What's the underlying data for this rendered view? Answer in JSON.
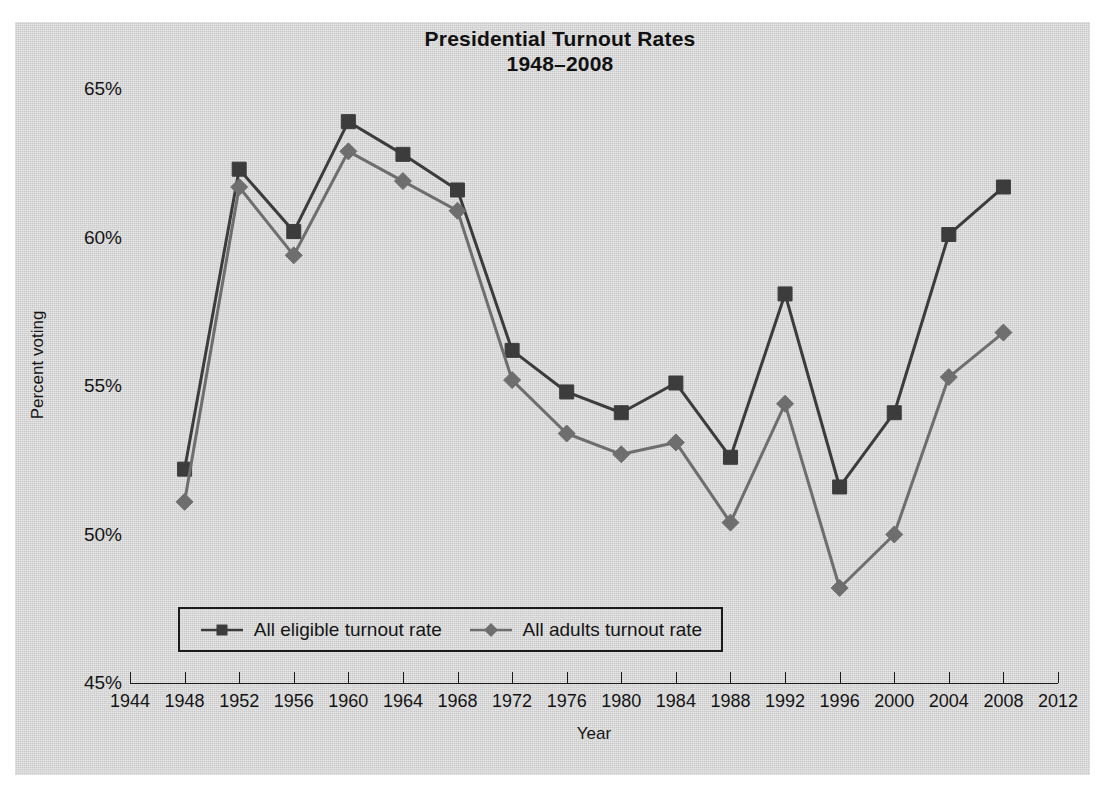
{
  "figure": {
    "title_line1": "Presidential Turnout Rates",
    "title_line2": "1948–2008",
    "panel_color": "#d8d8d8",
    "background_color": "#ffffff"
  },
  "axes": {
    "ylabel": "Percent voting",
    "xlabel": "Year",
    "yticks": [
      "65%",
      "60%",
      "55%",
      "50%",
      "45%"
    ],
    "xticks": [
      "1944",
      "1948",
      "1952",
      "1956",
      "1960",
      "1964",
      "1968",
      "1972",
      "1976",
      "1980",
      "1984",
      "1988",
      "1992",
      "1996",
      "2000",
      "2004",
      "2008",
      "2012"
    ]
  },
  "legend": {
    "entries": [
      {
        "label": "All eligible turnout rate",
        "marker": "square",
        "color": "#3c3c3c"
      },
      {
        "label": "All adults turnout rate",
        "marker": "diamond",
        "color": "#6e6e6e"
      }
    ]
  },
  "chart_data": {
    "type": "line",
    "title": "Presidential Turnout Rates 1948–2008",
    "xlabel": "Year",
    "ylabel": "Percent voting",
    "xlim": [
      1944,
      2012
    ],
    "ylim": [
      45,
      65
    ],
    "grid": false,
    "legend_position": "inside-bottom-left",
    "x": [
      1948,
      1952,
      1956,
      1960,
      1964,
      1968,
      1972,
      1976,
      1980,
      1984,
      1988,
      1992,
      1996,
      2000,
      2004,
      2008
    ],
    "categories": [
      "1948",
      "1952",
      "1956",
      "1960",
      "1964",
      "1968",
      "1972",
      "1976",
      "1980",
      "1984",
      "1988",
      "1992",
      "1996",
      "2000",
      "2004",
      "2008"
    ],
    "series": [
      {
        "name": "All eligible turnout rate",
        "marker": "square",
        "color": "#3c3c3c",
        "values": [
          52.2,
          62.3,
          60.2,
          63.9,
          62.8,
          61.6,
          56.2,
          54.8,
          54.1,
          55.1,
          52.6,
          58.1,
          51.6,
          54.1,
          60.1,
          61.7
        ]
      },
      {
        "name": "All adults turnout rate",
        "marker": "diamond",
        "color": "#6e6e6e",
        "values": [
          51.1,
          61.7,
          59.4,
          62.9,
          61.9,
          60.9,
          55.2,
          53.4,
          52.7,
          53.1,
          50.4,
          54.4,
          48.2,
          50.0,
          55.3,
          56.8
        ]
      }
    ]
  }
}
